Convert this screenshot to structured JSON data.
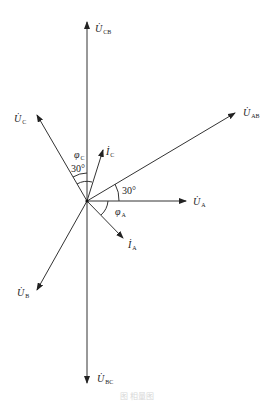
{
  "diagram": {
    "type": "phasor-diagram",
    "origin": [
      87,
      201
    ],
    "phasors": [
      {
        "id": "U_CB",
        "main": "U",
        "sub": "CB",
        "tip": [
          87,
          22
        ],
        "label_pos": [
          95,
          32
        ]
      },
      {
        "id": "U_AB",
        "main": "U",
        "sub": "AB",
        "tip": [
          235,
          113
        ],
        "label_pos": [
          243,
          116
        ]
      },
      {
        "id": "U_A",
        "main": "U",
        "sub": "A",
        "tip": [
          186,
          201
        ],
        "label_pos": [
          193,
          205
        ]
      },
      {
        "id": "U_C",
        "main": "U",
        "sub": "C",
        "tip": [
          37,
          115
        ],
        "label_pos": [
          14,
          122
        ]
      },
      {
        "id": "I_C",
        "main": "I",
        "sub": "C",
        "tip": [
          103,
          150
        ],
        "label_pos": [
          106,
          155
        ]
      },
      {
        "id": "I_A",
        "main": "I",
        "sub": "A",
        "tip": [
          123,
          238
        ],
        "label_pos": [
          128,
          248
        ]
      },
      {
        "id": "U_B",
        "main": "U",
        "sub": "B",
        "tip": [
          37,
          290
        ],
        "label_pos": [
          17,
          296
        ]
      },
      {
        "id": "U_BC",
        "main": "U",
        "sub": "BC",
        "tip": [
          87,
          383
        ],
        "label_pos": [
          97,
          382
        ]
      }
    ],
    "angles": [
      {
        "id": "phi_C",
        "text": "φ",
        "sub": "C",
        "pos": [
          74,
          158
        ]
      },
      {
        "id": "angle_30_upper",
        "text": "30°",
        "pos": [
          71,
          172
        ]
      },
      {
        "id": "angle_30_right",
        "text": "30°",
        "pos": [
          122,
          194
        ]
      },
      {
        "id": "phi_A",
        "text": "φ",
        "sub": "A",
        "pos": [
          115,
          215
        ]
      }
    ],
    "caption": "图 相量图"
  }
}
